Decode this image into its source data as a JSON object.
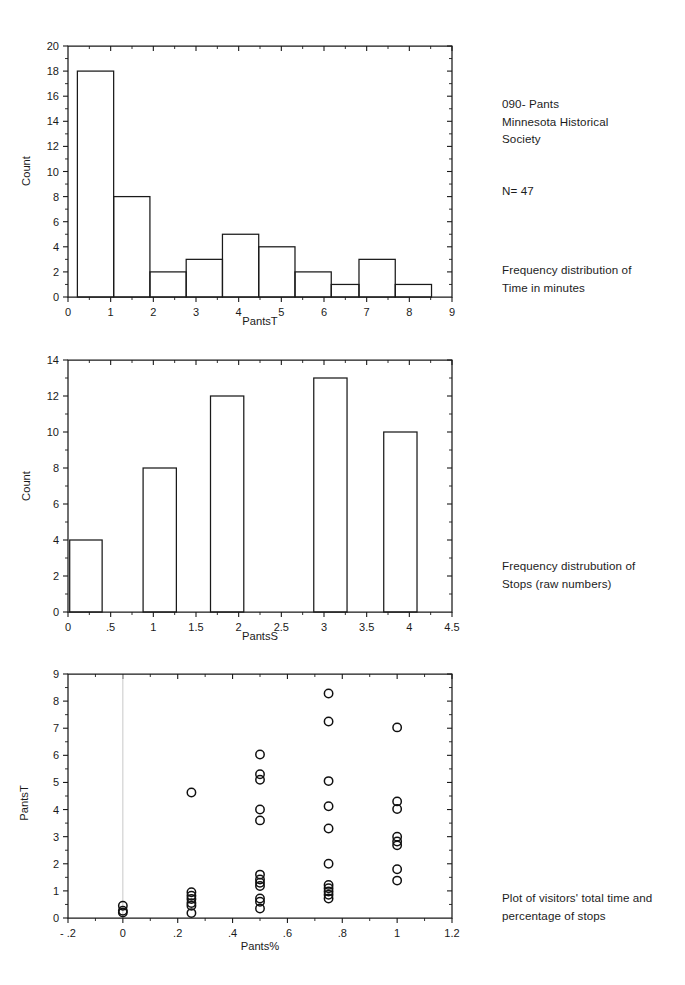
{
  "document": {
    "title_block": "090- Pants\nMinnesota Historical\nSociety",
    "sample_size": "N= 47",
    "caption_1": "Frequency distribution of\nTime in minutes",
    "caption_2": "Frequency distrubution of\nStops (raw numbers)",
    "caption_3": "Plot of visitors' total time and\npercentage of stops"
  },
  "chart_data": [
    {
      "id": "pantsT-histogram",
      "type": "bar",
      "title": "",
      "xlabel": "PantsT",
      "ylabel": "Count",
      "xlim": [
        0,
        9
      ],
      "ylim": [
        0,
        20
      ],
      "xticks": [
        "0",
        "1",
        "2",
        "3",
        "4",
        "5",
        "6",
        "7",
        "8",
        "9"
      ],
      "xtick_values": [
        0,
        1,
        2,
        3,
        4,
        5,
        6,
        7,
        8,
        9
      ],
      "yticks": [
        "0",
        "2",
        "4",
        "6",
        "8",
        "10",
        "12",
        "14",
        "16",
        "18",
        "20"
      ],
      "ytick_values": [
        0,
        2,
        4,
        6,
        8,
        10,
        12,
        14,
        16,
        18,
        20
      ],
      "grid": false,
      "legend": "none",
      "bin_width": 0.85,
      "bins": [
        {
          "x0": 0.22,
          "x1": 1.07,
          "count": 18
        },
        {
          "x0": 1.07,
          "x1": 1.92,
          "count": 8
        },
        {
          "x0": 1.92,
          "x1": 2.77,
          "count": 2
        },
        {
          "x0": 2.77,
          "x1": 3.62,
          "count": 3
        },
        {
          "x0": 3.62,
          "x1": 4.47,
          "count": 5
        },
        {
          "x0": 4.47,
          "x1": 5.32,
          "count": 4
        },
        {
          "x0": 5.32,
          "x1": 6.17,
          "count": 2
        },
        {
          "x0": 6.17,
          "x1": 6.82,
          "count": 1
        },
        {
          "x0": 6.82,
          "x1": 7.67,
          "count": 3
        },
        {
          "x0": 7.67,
          "x1": 8.52,
          "count": 1
        }
      ],
      "categories": [
        "0.2-1.1",
        "1.1-1.9",
        "1.9-2.8",
        "2.8-3.6",
        "3.6-4.5",
        "4.5-5.3",
        "5.3-6.2",
        "6.2-6.8",
        "6.8-7.7",
        "7.7-8.5"
      ],
      "values": [
        18,
        8,
        2,
        3,
        5,
        4,
        2,
        1,
        3,
        1
      ]
    },
    {
      "id": "pantsS-histogram",
      "type": "bar",
      "title": "",
      "xlabel": "PantsS",
      "ylabel": "Count",
      "xlim": [
        0,
        4.5
      ],
      "ylim": [
        0,
        14
      ],
      "xticks": [
        "0",
        ".5",
        "1",
        "1.5",
        "2",
        "2.5",
        "3",
        "3.5",
        "4",
        "4.5"
      ],
      "xtick_values": [
        0,
        0.5,
        1,
        1.5,
        2,
        2.5,
        3,
        3.5,
        4,
        4.5
      ],
      "yticks": [
        "0",
        "2",
        "4",
        "6",
        "8",
        "10",
        "12",
        "14"
      ],
      "ytick_values": [
        0,
        2,
        4,
        6,
        8,
        10,
        12,
        14
      ],
      "grid": false,
      "legend": "none",
      "bins": [
        {
          "x0": 0.02,
          "x1": 0.4,
          "count": 4
        },
        {
          "x0": 0.88,
          "x1": 1.27,
          "count": 8
        },
        {
          "x0": 1.67,
          "x1": 2.06,
          "count": 12
        },
        {
          "x0": 2.88,
          "x1": 3.27,
          "count": 13
        },
        {
          "x0": 3.7,
          "x1": 4.09,
          "count": 10
        }
      ],
      "categories": [
        "0",
        "1",
        "2",
        "3",
        "4"
      ],
      "values": [
        4,
        8,
        12,
        13,
        10
      ]
    },
    {
      "id": "pants-scatter",
      "type": "scatter",
      "title": "",
      "xlabel": "Pants%",
      "ylabel": "PantsT",
      "xlim": [
        -0.2,
        1.2
      ],
      "ylim": [
        0,
        9
      ],
      "xticks": [
        "- .2",
        "0",
        ".2",
        ".4",
        ".6",
        ".8",
        "1",
        "1.2"
      ],
      "xtick_values": [
        -0.2,
        0,
        0.2,
        0.4,
        0.6,
        0.8,
        1.0,
        1.2
      ],
      "yticks": [
        "0",
        "1",
        "2",
        "3",
        "4",
        "5",
        "6",
        "7",
        "8",
        "9"
      ],
      "ytick_values": [
        0,
        1,
        2,
        3,
        4,
        5,
        6,
        7,
        8,
        9
      ],
      "grid": false,
      "legend": "none",
      "reference_line_x": 0,
      "points": [
        {
          "x": 0.0,
          "y": 0.45
        },
        {
          "x": 0.0,
          "y": 0.27
        },
        {
          "x": 0.0,
          "y": 0.2
        },
        {
          "x": 0.25,
          "y": 4.63
        },
        {
          "x": 0.25,
          "y": 0.95
        },
        {
          "x": 0.25,
          "y": 0.82
        },
        {
          "x": 0.25,
          "y": 0.7
        },
        {
          "x": 0.25,
          "y": 0.55
        },
        {
          "x": 0.25,
          "y": 0.45
        },
        {
          "x": 0.25,
          "y": 0.18
        },
        {
          "x": 0.5,
          "y": 6.03
        },
        {
          "x": 0.5,
          "y": 5.3
        },
        {
          "x": 0.5,
          "y": 5.1
        },
        {
          "x": 0.5,
          "y": 4.0
        },
        {
          "x": 0.5,
          "y": 3.6
        },
        {
          "x": 0.5,
          "y": 1.6
        },
        {
          "x": 0.5,
          "y": 1.42
        },
        {
          "x": 0.5,
          "y": 1.3
        },
        {
          "x": 0.5,
          "y": 1.18
        },
        {
          "x": 0.5,
          "y": 0.72
        },
        {
          "x": 0.5,
          "y": 0.6
        },
        {
          "x": 0.5,
          "y": 0.35
        },
        {
          "x": 0.75,
          "y": 8.28
        },
        {
          "x": 0.75,
          "y": 7.25
        },
        {
          "x": 0.75,
          "y": 5.05
        },
        {
          "x": 0.75,
          "y": 4.12
        },
        {
          "x": 0.75,
          "y": 3.3
        },
        {
          "x": 0.75,
          "y": 2.0
        },
        {
          "x": 0.75,
          "y": 1.22
        },
        {
          "x": 0.75,
          "y": 1.1
        },
        {
          "x": 0.75,
          "y": 0.98
        },
        {
          "x": 0.75,
          "y": 0.86
        },
        {
          "x": 0.75,
          "y": 0.72
        },
        {
          "x": 1.0,
          "y": 7.03
        },
        {
          "x": 1.0,
          "y": 4.3
        },
        {
          "x": 1.0,
          "y": 4.02
        },
        {
          "x": 1.0,
          "y": 3.0
        },
        {
          "x": 1.0,
          "y": 2.82
        },
        {
          "x": 1.0,
          "y": 2.68
        },
        {
          "x": 1.0,
          "y": 1.8
        },
        {
          "x": 1.0,
          "y": 1.38
        }
      ]
    }
  ]
}
